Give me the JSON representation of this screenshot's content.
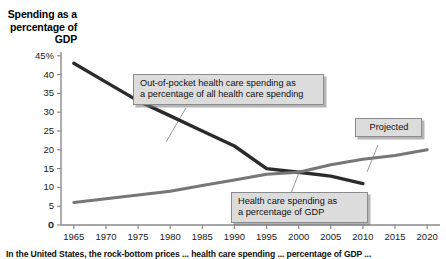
{
  "chart_data": {
    "type": "line",
    "title": "Spending as a\npercentage\nof GDP",
    "xlabel": "",
    "ylabel": "Spending as a percentage of GDP",
    "grid": false,
    "legend_position": "none",
    "xlim": [
      1963,
      2022
    ],
    "ylim": [
      0,
      46
    ],
    "y_ticks": [
      "0",
      "5",
      "10",
      "15",
      "20",
      "25",
      "30",
      "35",
      "40",
      "45%"
    ],
    "y_tick_values": [
      0,
      5,
      10,
      15,
      20,
      25,
      30,
      35,
      40,
      45
    ],
    "x_ticks": [
      "1965",
      "1970",
      "1975",
      "1980",
      "1985",
      "1990",
      "1995",
      "2000",
      "2005",
      "2010",
      "2015",
      "2020"
    ],
    "x_tick_values": [
      1965,
      1970,
      1975,
      1980,
      1985,
      1990,
      1995,
      2000,
      2005,
      2010,
      2015,
      2020
    ],
    "origin_label": "0",
    "series": [
      {
        "name": "Out-of-pocket health care spending as a percentage of all health care spending",
        "color": "#2b2b2b",
        "width": 3.4,
        "x": [
          1965,
          1970,
          1975,
          1980,
          1985,
          1990,
          1995,
          2000,
          2005,
          2010
        ],
        "values": [
          43,
          38,
          33,
          29,
          25,
          21,
          15,
          14,
          13,
          11
        ]
      },
      {
        "name": "Health care spending as a percentage of GDP",
        "color": "#777777",
        "width": 3.0,
        "x": [
          1965,
          1970,
          1975,
          1980,
          1985,
          1990,
          1995,
          2000,
          2005,
          2010,
          2015,
          2020
        ],
        "values": [
          6,
          7,
          8,
          9,
          10.5,
          12,
          13.5,
          14,
          16,
          17.5,
          18.5,
          20
        ]
      }
    ],
    "annotations": [
      {
        "id": "out-of-pocket",
        "text": "Out-of-pocket health care spending as\na percentage of all health care spending"
      },
      {
        "id": "gdp-share",
        "text": "Health care spending as\na percentage of GDP"
      },
      {
        "id": "projected",
        "text": "Projected"
      }
    ]
  },
  "caption": {
    "text": "In the United States, the rock-bottom prices ... health care spending ... percentage of GDP ..."
  },
  "colors": {
    "series_dark": "#2b2b2b",
    "series_gray": "#777777",
    "axis": "#8a8a8a",
    "callout_fill": "#dcdcdc",
    "callout_border": "#8c8c8c"
  }
}
